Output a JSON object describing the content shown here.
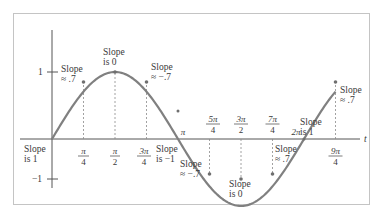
{
  "diagram": {
    "type": "sine-curve-slope-annotations",
    "axis": {
      "x_label": "t",
      "y_ticks": [
        {
          "label": "1",
          "value": 1
        },
        {
          "label": "−1",
          "value": -1
        }
      ]
    },
    "x_ticks": [
      {
        "num": "π",
        "den": "4",
        "pos": "below"
      },
      {
        "num": "π",
        "den": "2",
        "pos": "below"
      },
      {
        "num": "3π",
        "den": "4",
        "pos": "below"
      },
      {
        "label": "π",
        "pos": "above"
      },
      {
        "num": "5π",
        "den": "4",
        "pos": "above"
      },
      {
        "num": "3π",
        "den": "2",
        "pos": "above"
      },
      {
        "num": "7π",
        "den": "4",
        "pos": "above"
      },
      {
        "label": "2π",
        "pos": "above"
      },
      {
        "num": "9π",
        "den": "4",
        "pos": "below"
      }
    ],
    "annotations": [
      {
        "line1": "Slope",
        "line2": "is 1"
      },
      {
        "line1": "Slope",
        "line2": "≈ .7"
      },
      {
        "line1": "Slope",
        "line2": "is 0"
      },
      {
        "line1": "Slope",
        "line2": "≈ −.7"
      },
      {
        "line1": "Slope",
        "line2": "is −1"
      },
      {
        "line1": "Slope",
        "line2": "≈ −.7"
      },
      {
        "line1": "Slope",
        "line2": "is 0"
      },
      {
        "line1": "Slope",
        "line2": "≈ .7"
      },
      {
        "line1": "Slope",
        "line2": "is 1"
      },
      {
        "line1": "Slope",
        "line2": "≈ .7"
      }
    ],
    "colors": {
      "curve": "#7a7a7a",
      "axis": "#555555",
      "frame": "#bdbdbd",
      "guide": "#8a8a8a"
    }
  }
}
